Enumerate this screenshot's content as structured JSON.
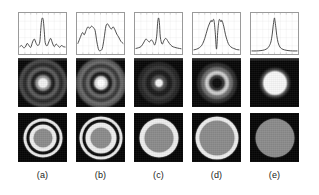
{
  "figure": {
    "panel_count": 5,
    "row_labels": [
      "intensity profile",
      "far-field diffraction pattern",
      "aperture mask"
    ],
    "background": "#ffffff",
    "plot_stroke": "#3a3a3a",
    "grid_color": "#d8d8d8",
    "frame_color": "#9a9a9a",
    "dark_bg": "#080808"
  },
  "columns": [
    {
      "id": "a",
      "caption": "(a)",
      "x": 18,
      "chart_data": {
        "type": "line",
        "title": "",
        "xlabel": "",
        "ylabel": "",
        "xlim": [
          0,
          100
        ],
        "ylim": [
          0,
          1
        ],
        "grid": true,
        "legend": "none",
        "x": [
          0,
          4,
          8,
          12,
          16,
          20,
          24,
          28,
          32,
          36,
          40,
          44,
          46,
          48,
          50,
          52,
          54,
          56,
          60,
          64,
          68,
          72,
          76,
          80,
          84,
          88,
          92,
          96,
          100
        ],
        "values": [
          0.17,
          0.2,
          0.14,
          0.16,
          0.26,
          0.2,
          0.15,
          0.3,
          0.38,
          0.26,
          0.2,
          0.3,
          0.62,
          0.9,
          0.97,
          0.88,
          0.58,
          0.28,
          0.19,
          0.3,
          0.4,
          0.27,
          0.17,
          0.24,
          0.2,
          0.15,
          0.2,
          0.17,
          0.16
        ]
      },
      "pattern": {
        "description": "bright central spot with several concentric dark and grey diffraction rings",
        "rings": [
          {
            "r": 23,
            "color": "#4a4a4a"
          },
          {
            "r": 19,
            "color": "#2b2b2b"
          },
          {
            "r": 15,
            "color": "#5e5e5e"
          },
          {
            "r": 11,
            "color": "#1d1d1d"
          },
          {
            "r": 7,
            "color": "#8a8a8a"
          },
          {
            "r": 4,
            "color": "#f2f2f2"
          }
        ]
      },
      "mask": {
        "description": "grey central disc, white annulus, dark gap, second white annulus",
        "rings": [
          {
            "r": 19,
            "color": "#efefef"
          },
          {
            "r": 16,
            "color": "#0a0a0a"
          },
          {
            "r": 13,
            "color": "#efefef"
          },
          {
            "r": 9,
            "color": "#8c8c8c"
          }
        ]
      }
    },
    {
      "id": "b",
      "caption": "(b)",
      "x": 76,
      "chart_data": {
        "type": "line",
        "title": "",
        "xlabel": "",
        "ylabel": "",
        "xlim": [
          0,
          100
        ],
        "ylim": [
          0,
          1
        ],
        "grid": true,
        "legend": "none",
        "x": [
          0,
          5,
          10,
          14,
          18,
          22,
          26,
          30,
          34,
          38,
          42,
          46,
          50,
          54,
          58,
          62,
          66,
          70,
          74,
          78,
          82,
          86,
          90,
          95,
          100
        ],
        "values": [
          0.26,
          0.42,
          0.56,
          0.5,
          0.62,
          0.72,
          0.68,
          0.74,
          0.7,
          0.62,
          0.3,
          0.08,
          0.06,
          0.12,
          0.4,
          0.74,
          0.8,
          0.72,
          0.66,
          0.72,
          0.64,
          0.52,
          0.44,
          0.32,
          0.26
        ]
      },
      "pattern": {
        "description": "bright core with dark first ring and several broad bright outer rings",
        "rings": [
          {
            "r": 24,
            "color": "#555555"
          },
          {
            "r": 21,
            "color": "#6f6f6f"
          },
          {
            "r": 18,
            "color": "#3a3a3a"
          },
          {
            "r": 14,
            "color": "#6a6a6a"
          },
          {
            "r": 10,
            "color": "#1a1a1a"
          },
          {
            "r": 6,
            "color": "#d8d8d8"
          },
          {
            "r": 3,
            "color": "#ffffff"
          }
        ]
      },
      "mask": {
        "description": "grey central disc, white annulus, dark gap, outer white annulus",
        "rings": [
          {
            "r": 21,
            "color": "#efefef"
          },
          {
            "r": 18,
            "color": "#0a0a0a"
          },
          {
            "r": 15,
            "color": "#efefef"
          },
          {
            "r": 10,
            "color": "#8c8c8c"
          }
        ]
      }
    },
    {
      "id": "c",
      "caption": "(c)",
      "x": 134,
      "chart_data": {
        "type": "line",
        "title": "",
        "xlabel": "",
        "ylabel": "",
        "xlim": [
          0,
          100
        ],
        "ylim": [
          0,
          1
        ],
        "grid": true,
        "legend": "none",
        "x": [
          0,
          6,
          12,
          18,
          22,
          26,
          30,
          34,
          38,
          42,
          46,
          48,
          50,
          52,
          54,
          58,
          62,
          66,
          70,
          74,
          80,
          86,
          92,
          100
        ],
        "values": [
          0.12,
          0.14,
          0.18,
          0.3,
          0.38,
          0.34,
          0.3,
          0.36,
          0.3,
          0.22,
          0.46,
          0.82,
          0.97,
          0.84,
          0.44,
          0.24,
          0.34,
          0.4,
          0.34,
          0.26,
          0.18,
          0.15,
          0.13,
          0.11
        ]
      },
      "pattern": {
        "description": "small bright core, dark surround, faint broad outer halo ring",
        "rings": [
          {
            "r": 20,
            "color": "#262626"
          },
          {
            "r": 16,
            "color": "#383838"
          },
          {
            "r": 12,
            "color": "#1c1c1c"
          },
          {
            "r": 7,
            "color": "#4a4a4a"
          },
          {
            "r": 3,
            "color": "#f5f5f5"
          }
        ]
      },
      "mask": {
        "description": "grey central disc with a single thick white annulus",
        "rings": [
          {
            "r": 19,
            "color": "#efefef"
          },
          {
            "r": 14,
            "color": "#8c8c8c"
          }
        ]
      }
    },
    {
      "id": "d",
      "caption": "(d)",
      "x": 192,
      "chart_data": {
        "type": "line",
        "title": "",
        "xlabel": "",
        "ylabel": "",
        "xlim": [
          0,
          100
        ],
        "ylim": [
          0,
          1
        ],
        "grid": true,
        "legend": "none",
        "x": [
          0,
          6,
          12,
          18,
          24,
          30,
          34,
          38,
          40,
          44,
          47,
          50,
          53,
          56,
          60,
          62,
          66,
          70,
          76,
          82,
          88,
          94,
          100
        ],
        "values": [
          0.08,
          0.1,
          0.14,
          0.22,
          0.4,
          0.66,
          0.8,
          0.9,
          0.86,
          0.92,
          0.6,
          0.1,
          0.62,
          0.92,
          0.86,
          0.9,
          0.74,
          0.5,
          0.26,
          0.16,
          0.12,
          0.09,
          0.08
        ]
      },
      "pattern": {
        "description": "dark centre surrounded by a thick bright annulus (doughnut) and faint halo",
        "rings": [
          {
            "r": 19,
            "color": "#2e2e2e"
          },
          {
            "r": 15,
            "color": "#6b6b6b"
          },
          {
            "r": 11,
            "color": "#cfcfcf"
          },
          {
            "r": 7,
            "color": "#3a3a3a"
          },
          {
            "r": 4,
            "color": "#0d0d0d"
          }
        ]
      },
      "mask": {
        "description": "large grey disc with a thin white outer annulus",
        "rings": [
          {
            "r": 21,
            "color": "#efefef"
          },
          {
            "r": 17,
            "color": "#8c8c8c"
          }
        ]
      }
    },
    {
      "id": "e",
      "caption": "(e)",
      "x": 250,
      "chart_data": {
        "type": "line",
        "title": "",
        "xlabel": "",
        "ylabel": "",
        "xlim": [
          0,
          100
        ],
        "ylim": [
          0,
          1
        ],
        "grid": true,
        "legend": "none",
        "x": [
          0,
          10,
          20,
          28,
          34,
          38,
          42,
          45,
          47,
          49,
          50,
          51,
          53,
          55,
          58,
          62,
          66,
          72,
          80,
          90,
          100
        ],
        "values": [
          0.05,
          0.05,
          0.06,
          0.08,
          0.12,
          0.18,
          0.3,
          0.52,
          0.74,
          0.92,
          0.97,
          0.9,
          0.7,
          0.48,
          0.28,
          0.16,
          0.11,
          0.08,
          0.06,
          0.05,
          0.05
        ]
      },
      "pattern": {
        "description": "single bright uniform disc on dark background, no rings",
        "rings": [
          {
            "r": 14,
            "color": "#3c3c3c"
          },
          {
            "r": 11,
            "color": "#f7f7f7"
          }
        ]
      },
      "mask": {
        "description": "plain grey disc, no white annulus",
        "rings": [
          {
            "r": 19,
            "color": "#8c8c8c"
          }
        ]
      }
    }
  ]
}
